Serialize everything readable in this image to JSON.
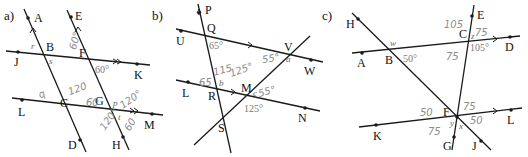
{
  "panels": [
    {
      "id": "a",
      "label": "a)",
      "points": {
        "A": "A",
        "B": "B",
        "C": "C",
        "D": "D",
        "E": "E",
        "F": "F",
        "G": "G",
        "H": "H",
        "J": "J",
        "K": "K",
        "L": "L",
        "M": "M"
      },
      "printed_angles": {
        "angle_FK": "60°"
      },
      "variables": {
        "r": "r",
        "s": "s",
        "p": "p",
        "t": "t"
      },
      "handwritten": {
        "h1": "60°",
        "h2": "120",
        "h3": "60",
        "h4": "120°",
        "h5": "120°",
        "h6": "60",
        "h7": "q"
      }
    },
    {
      "id": "b",
      "label": "b)",
      "points": {
        "P": "P",
        "Q": "Q",
        "U": "U",
        "V": "V",
        "W": "W",
        "L": "L",
        "R": "R",
        "M": "M",
        "N": "N",
        "S": "S"
      },
      "printed_angles": {
        "angle_Q": "65°",
        "angle_M": "125°"
      },
      "variables": {
        "a": "a",
        "b": "b",
        "c": "c"
      },
      "handwritten": {
        "h1": "55°",
        "h2": "115",
        "h3": "125°",
        "h4": "65",
        "h5": "55°"
      }
    },
    {
      "id": "c",
      "label": "c)",
      "points": {
        "H": "H",
        "A": "A",
        "B": "B",
        "C": "C",
        "D": "D",
        "E": "E",
        "F": "F",
        "G": "G",
        "J": "J",
        "K": "K",
        "L": "L"
      },
      "printed_angles": {
        "angle_B": "50°",
        "angle_C": "105°"
      },
      "variables": {
        "w": "w",
        "y": "y",
        "x": "x",
        "z": "z"
      },
      "handwritten": {
        "h1": "105",
        "h2": "75",
        "h3": "75",
        "h4": "50",
        "h5": "75",
        "h6": "50",
        "h7": "75"
      }
    }
  ],
  "colors": {
    "line": "#1a1a1a",
    "printed_angle": "#7a7a7a",
    "handwriting": "#8c8c8c"
  }
}
